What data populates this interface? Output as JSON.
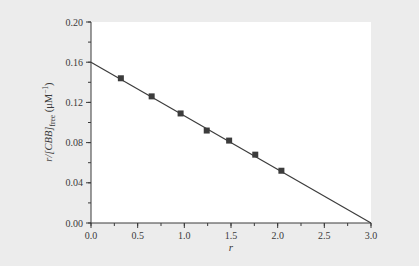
{
  "chart_data": {
    "type": "scatter",
    "title": "",
    "xlabel": "r",
    "ylabel": {
      "prefix": "r/[CBB]",
      "subscript": "free",
      "units_open": " (μM",
      "units_sup": "−1",
      "units_close": ")"
    },
    "xlim": [
      0.0,
      3.0
    ],
    "ylim": [
      0.0,
      0.2
    ],
    "x_ticks": [
      "0.0",
      "0.5",
      "1.0",
      "1.5",
      "2.0",
      "2.5",
      "3.0"
    ],
    "x_tick_values": [
      0.0,
      0.5,
      1.0,
      1.5,
      2.0,
      2.5,
      3.0
    ],
    "x_minor_step": 0.25,
    "y_ticks": [
      "0.00",
      "0.04",
      "0.08",
      "0.12",
      "0.16",
      "0.20"
    ],
    "y_tick_values": [
      0.0,
      0.04,
      0.08,
      0.12,
      0.16,
      0.2
    ],
    "y_minor_step": 0.02,
    "grid": false,
    "legend": null,
    "series": [
      {
        "name": "data",
        "marker": "square",
        "x": [
          0.32,
          0.65,
          0.96,
          1.24,
          1.48,
          1.76,
          2.04
        ],
        "y": [
          0.144,
          0.126,
          0.109,
          0.092,
          0.082,
          0.068,
          0.052
        ]
      },
      {
        "name": "linear fit",
        "marker": "line",
        "x": [
          0.0,
          3.0
        ],
        "y": [
          0.16,
          0.0
        ]
      }
    ],
    "colors": {
      "background": "#ececec",
      "plot_area": "#ffffff",
      "axis": "#3a3a3a",
      "marker": "#3c3c3c",
      "line": "#3c3c3c"
    }
  }
}
